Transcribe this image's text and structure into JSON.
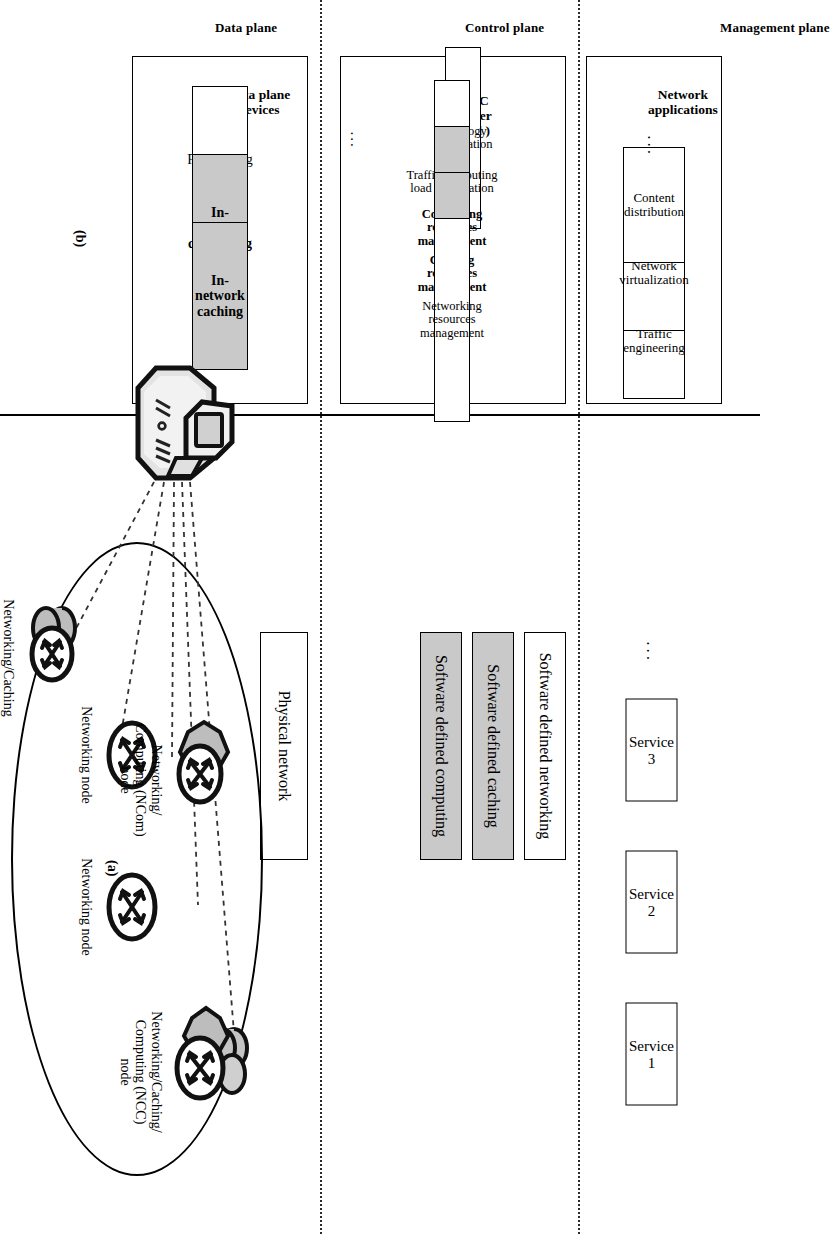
{
  "figure": {
    "subfigure_a_caption": "(a)",
    "subfigure_b_caption": "(b)"
  },
  "planes": {
    "management": "Management plane",
    "control": "Control plane",
    "data": "Data plane"
  },
  "management_plane": {
    "services": [
      "Service 1",
      "Service 2",
      "Service 3"
    ],
    "ellipsis": "...",
    "network_applications_title": "Network\napplications",
    "applications": [
      "Traffic\nengineering",
      "Network\nvirtualization",
      "Content\ndistribution"
    ],
    "applications_ellipsis": "..."
  },
  "control_plane": {
    "software_defined_layers": [
      {
        "label": "Software defined networking",
        "shaded": false
      },
      {
        "label": "Software defined caching",
        "shaded": true
      },
      {
        "label": "Software defined computing",
        "shaded": true
      }
    ],
    "controller_title": "SD-NCC\ncontroller\n( logical )",
    "controller_modules": [
      {
        "label": "Topology information",
        "shaded": false
      },
      {
        "label": "Traffic/computing load information",
        "shaded": false
      },
      {
        "label": "Computing resources management",
        "shaded": true
      },
      {
        "label": "Caching resources management",
        "shaded": true
      },
      {
        "label": "Networking resources management",
        "shaded": false
      }
    ],
    "controller_ellipsis": "..."
  },
  "data_plane": {
    "physical_network_label": "Physical network",
    "devices_title": "Data plane\ndevices",
    "device_functions": [
      {
        "label": "Forwarding",
        "shaded": false
      },
      {
        "label": "In-network computing",
        "shaded": true
      },
      {
        "label": "In-network caching",
        "shaded": true
      }
    ],
    "nodes": [
      {
        "id": "nca",
        "label": "Networking/Caching\n(NCa) node",
        "type": "caching"
      },
      {
        "id": "net1",
        "label": "Networking node",
        "type": "plain"
      },
      {
        "id": "ncom",
        "label": "Networking/\nComputing (NCom)\nnode",
        "type": "computing"
      },
      {
        "id": "net2",
        "label": "Networking node",
        "type": "plain"
      },
      {
        "id": "ncc",
        "label": "Networking/Caching/\nComputing (NCC)\nnode",
        "type": "caching-computing"
      }
    ],
    "controller_device_name": "sd-ncc-controller-server"
  },
  "colors": {
    "shaded_fill": "#c9c9c9",
    "line": "#000000",
    "node_gray": "#bdbdbd"
  }
}
